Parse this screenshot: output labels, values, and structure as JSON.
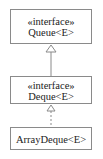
{
  "diagram": {
    "type": "uml-class-hierarchy",
    "nodes": [
      {
        "id": "queue",
        "stereotype": "«interface»",
        "name": "Queue<E>"
      },
      {
        "id": "deque",
        "stereotype": "«interface»",
        "name": "Deque<E>"
      },
      {
        "id": "arraydeque",
        "stereotype": "",
        "name": "ArrayDeque<E>"
      }
    ],
    "edges": [
      {
        "from": "deque",
        "to": "queue",
        "kind": "generalization",
        "style": "solid"
      },
      {
        "from": "arraydeque",
        "to": "deque",
        "kind": "realization",
        "style": "dashed"
      }
    ],
    "colors": {
      "border": "#8a8a8a",
      "text": "#222222",
      "background": "#ffffff"
    }
  }
}
